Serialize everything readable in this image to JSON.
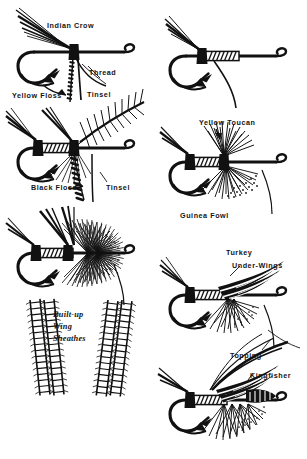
{
  "illustration": {
    "title": "Salmon fly tying sequence",
    "ink_color": "#111111",
    "paper_color": "#ffffff"
  },
  "labels": [
    {
      "id": "indian-crow",
      "text": "Indian Crow",
      "style": "block"
    },
    {
      "id": "thread",
      "text": "Thread",
      "style": "block"
    },
    {
      "id": "tinsel-top",
      "text": "Tinsel",
      "style": "block"
    },
    {
      "id": "yellow-floss",
      "text": "Yellow Floss",
      "style": "block"
    },
    {
      "id": "black-floss",
      "text": "Black Floss",
      "style": "block"
    },
    {
      "id": "tinsel-mid",
      "text": "Tinsel",
      "style": "block"
    },
    {
      "id": "yellow-toucan",
      "text": "Yellow Toucan",
      "style": "block"
    },
    {
      "id": "guinea-fowl",
      "text": "Guinea Fowl",
      "style": "block"
    },
    {
      "id": "turkey",
      "text": "Turkey",
      "style": "block"
    },
    {
      "id": "under-wings",
      "text": "Under-Wings",
      "style": "block"
    },
    {
      "id": "topping",
      "text": "Topping",
      "style": "block"
    },
    {
      "id": "kingfisher",
      "text": "Kingfisher",
      "style": "block"
    },
    {
      "id": "built-up",
      "text": "Built-up",
      "style": "script"
    },
    {
      "id": "wing",
      "text": "Wing",
      "style": "script"
    },
    {
      "id": "sheathes",
      "text": "Sheathes",
      "style": "script"
    }
  ],
  "figures": [
    {
      "id": "fig-1",
      "caption": "Hook with Indian Crow, thread, tinsel and yellow floss"
    },
    {
      "id": "fig-2",
      "caption": "Hook with tinsel body wraps"
    },
    {
      "id": "fig-3",
      "caption": "Hook with black floss, tinsel and hackle"
    },
    {
      "id": "fig-4",
      "caption": "Hook with yellow toucan and guinea fowl"
    },
    {
      "id": "fig-5",
      "caption": "Hook with full hackle collar"
    },
    {
      "id": "fig-6",
      "caption": "Hook with turkey under-wings"
    },
    {
      "id": "fig-7",
      "caption": "Finished fly with topping and kingfisher"
    },
    {
      "id": "fig-8",
      "caption": "Built-up wing sheathes feather strips"
    }
  ]
}
